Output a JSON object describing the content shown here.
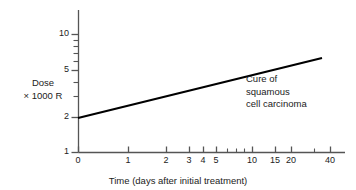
{
  "chart_data": {
    "type": "line",
    "title": "",
    "xlabel": "Time (days after initial treatment)",
    "ylabel_line1": "Dose",
    "ylabel_line2": "× 1000 R",
    "xscale": "log",
    "yscale": "log",
    "xlim": [
      0,
      48
    ],
    "ylim": [
      1,
      13
    ],
    "grid": false,
    "legend": "none",
    "x_ticks": [
      {
        "value": 0,
        "label": "0",
        "px": 78
      },
      {
        "value": 1,
        "label": "1",
        "px": 128
      },
      {
        "value": 2,
        "label": "2",
        "px": 166
      },
      {
        "value": 3,
        "label": "3",
        "px": 189
      },
      {
        "value": 4,
        "label": "4",
        "px": 203
      },
      {
        "value": 5,
        "label": "5",
        "px": 216
      },
      {
        "value": 6,
        "label": "",
        "px": 227
      },
      {
        "value": 7,
        "label": "",
        "px": 236
      },
      {
        "value": 8,
        "label": "",
        "px": 244
      },
      {
        "value": 10,
        "label": "10",
        "px": 252
      },
      {
        "value": 15,
        "label": "15",
        "px": 275
      },
      {
        "value": 20,
        "label": "20",
        "px": 291
      },
      {
        "value": 30,
        "label": "",
        "px": 314
      },
      {
        "value": 40,
        "label": "40",
        "px": 330
      }
    ],
    "y_ticks": [
      {
        "value": 1,
        "label": "1",
        "px": 152
      },
      {
        "value": 2,
        "label": "2",
        "px": 117
      },
      {
        "value": 3,
        "label": "",
        "px": 96
      },
      {
        "value": 4,
        "label": "",
        "px": 82
      },
      {
        "value": 5,
        "label": "5",
        "px": 70
      },
      {
        "value": 6,
        "label": "",
        "px": 61
      },
      {
        "value": 7,
        "label": "",
        "px": 53
      },
      {
        "value": 8,
        "label": "",
        "px": 46
      },
      {
        "value": 9,
        "label": "",
        "px": 40
      },
      {
        "value": 10,
        "label": "10",
        "px": 34
      }
    ],
    "series": [
      {
        "name": "Cure of squamous cell carcinoma",
        "points": [
          {
            "x": 0,
            "y": 2.0
          },
          {
            "x": 40,
            "y": 6.0
          }
        ],
        "pixel_points": [
          {
            "px": 78,
            "py": 118
          },
          {
            "px": 322,
            "py": 58
          }
        ],
        "color": "#000000",
        "linewidth": 2.2
      }
    ],
    "annotations": [
      {
        "text_line1": "Cure of",
        "text_line2": "squamous",
        "text_line3": "cell carcinoma"
      }
    ]
  },
  "axes": {
    "x_axis_color": "#555555",
    "y_axis_color": "#555555",
    "background": "#ffffff"
  }
}
